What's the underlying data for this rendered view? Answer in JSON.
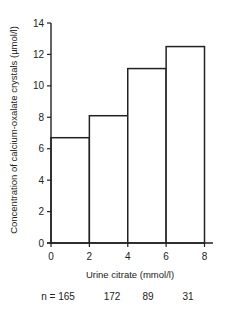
{
  "chart_data": {
    "type": "bar",
    "subtype": "histogram",
    "title": "",
    "xlabel": "Urine citrate (mmol/l)",
    "ylabel": "Concentration of calcium-oxalate crystals (µmol/l)",
    "bins": [
      {
        "x0": 0,
        "x1": 2,
        "value": 6.7,
        "n": "165"
      },
      {
        "x0": 2,
        "x1": 4,
        "value": 8.1,
        "n": "172"
      },
      {
        "x0": 4,
        "x1": 6,
        "value": 11.1,
        "n": "89"
      },
      {
        "x0": 6,
        "x1": 8,
        "value": 12.5,
        "n": "31"
      }
    ],
    "categories": [
      "0-2",
      "2-4",
      "4-6",
      "6-8"
    ],
    "values": [
      6.7,
      8.1,
      11.1,
      12.5
    ],
    "xlim": [
      0,
      8
    ],
    "ylim": [
      0,
      14
    ],
    "xticks": [
      0,
      2,
      4,
      6,
      8
    ],
    "yticks": [
      0,
      2,
      4,
      6,
      8,
      10,
      12,
      14
    ],
    "n_prefix": "n = ",
    "grid": false,
    "legend": "none",
    "bar_fill": "#ffffff",
    "line_color": "#222222"
  }
}
